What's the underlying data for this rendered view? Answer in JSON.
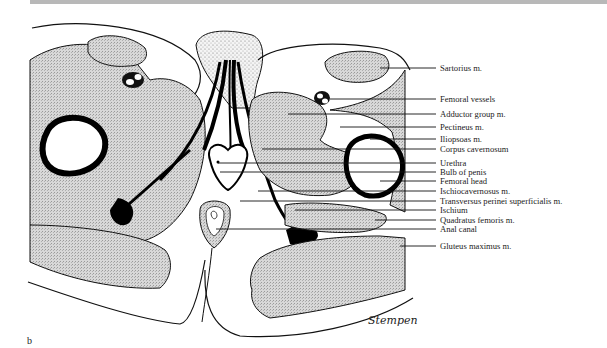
{
  "figure": {
    "panel_letter": "b",
    "signature": "Stempen",
    "colors": {
      "tissue_fill": "#d6d6d6",
      "outline": "#111111",
      "bone_black": "#0a0a0a",
      "background": "#ffffff"
    }
  },
  "labels": [
    {
      "text": "Sartorius m.",
      "y": 69
    },
    {
      "text": "Femoral vessels",
      "y": 100
    },
    {
      "text": "Adductor group m.",
      "y": 115
    },
    {
      "text": "Pectineus m.",
      "y": 128
    },
    {
      "text": "Iliopsoas m.",
      "y": 140
    },
    {
      "text": "Corpus cavernosum",
      "y": 150
    },
    {
      "text": "Urethra",
      "y": 166
    },
    {
      "text": "Bulb of penis",
      "y": 175
    },
    {
      "text": "Femoral head",
      "y": 184
    },
    {
      "text": "Ischiocavernosus m.",
      "y": 194
    },
    {
      "text": "Transversus perinei superficialis m.",
      "y": 204
    },
    {
      "text": "Ischium",
      "y": 213
    },
    {
      "text": "Quadratus femoris m.",
      "y": 222
    },
    {
      "text": "Anal canal",
      "y": 231
    },
    {
      "text": "Gluteus maximus m.",
      "y": 248
    }
  ]
}
